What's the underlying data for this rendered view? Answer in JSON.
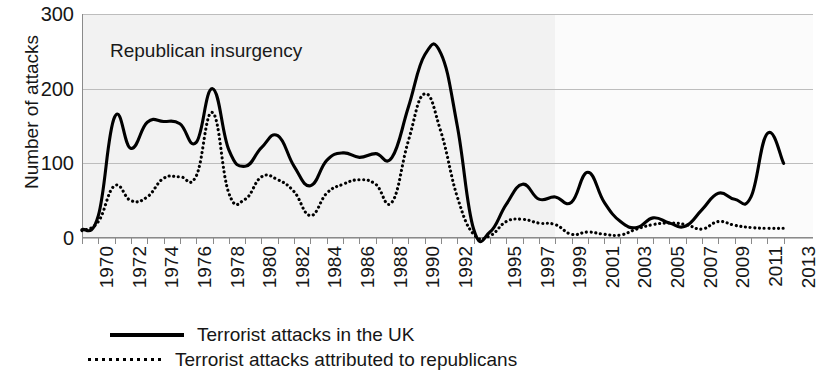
{
  "chart_data": {
    "type": "line",
    "title": "",
    "xlabel": "",
    "ylabel": "Number of attacks",
    "ylim": [
      0,
      300
    ],
    "yticks": [
      0,
      100,
      200,
      300
    ],
    "grid": true,
    "legend_position": "bottom",
    "annotations": [
      {
        "text": "Republican insurgency",
        "x": 1971,
        "y": 262
      }
    ],
    "x": [
      1970,
      1971,
      1972,
      1973,
      1974,
      1975,
      1976,
      1977,
      1978,
      1979,
      1980,
      1981,
      1982,
      1983,
      1984,
      1985,
      1986,
      1987,
      1988,
      1989,
      1990,
      1991,
      1992,
      1993,
      1994,
      1995,
      1996,
      1997,
      1998,
      1999,
      2000,
      2001,
      2002,
      2003,
      2004,
      2005,
      2006,
      2007,
      2008,
      2009,
      2010,
      2011,
      2012,
      2013
    ],
    "xtick_labels": [
      "1970",
      "1972",
      "1974",
      "1976",
      "1978",
      "1980",
      "1982",
      "1984",
      "1986",
      "1988",
      "1990",
      "1992",
      "1995",
      "1997",
      "1999",
      "2001",
      "2003",
      "2005",
      "2007",
      "2009",
      "2011",
      "2013"
    ],
    "xtick_years": [
      1970,
      1972,
      1974,
      1976,
      1978,
      1980,
      1982,
      1984,
      1986,
      1988,
      1990,
      1992,
      1995,
      1997,
      1999,
      2001,
      2003,
      2005,
      2007,
      2009,
      2011,
      2013
    ],
    "series": [
      {
        "name": "Terrorist attacks in the UK",
        "style": "solid",
        "color": "#000000",
        "values": [
          11,
          30,
          162,
          120,
          155,
          156,
          153,
          128,
          200,
          118,
          96,
          121,
          137,
          96,
          70,
          104,
          114,
          108,
          113,
          108,
          175,
          245,
          247,
          150,
          12,
          8,
          45,
          72,
          52,
          55,
          48,
          88,
          48,
          22,
          14,
          27,
          20,
          16,
          38,
          60,
          52,
          55,
          140,
          100
        ]
      },
      {
        "name": "Terrorist attacks attributed to republicans",
        "style": "dotted",
        "color": "#000000",
        "values": [
          10,
          22,
          70,
          50,
          55,
          80,
          82,
          83,
          168,
          60,
          52,
          82,
          78,
          62,
          30,
          60,
          72,
          78,
          72,
          48,
          130,
          193,
          142,
          55,
          5,
          3,
          22,
          25,
          20,
          18,
          5,
          8,
          5,
          4,
          12,
          18,
          20,
          18,
          12,
          22,
          17,
          14,
          13,
          13
        ]
      }
    ]
  },
  "legend": {
    "items": [
      {
        "label": "Terrorist attacks in the UK",
        "style": "solid"
      },
      {
        "label": "Terrorist attacks attributed to republicans",
        "style": "dotted"
      }
    ]
  },
  "axes": {
    "y_title": "Number of attacks"
  }
}
